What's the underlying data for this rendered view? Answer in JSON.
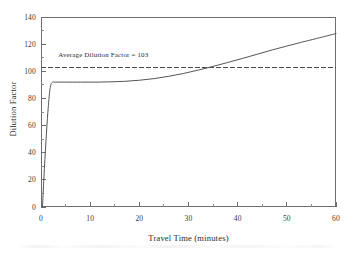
{
  "chart_data": {
    "type": "line",
    "title": "",
    "xlabel": "Travel Time (minutes)",
    "ylabel": "Dilution Factor",
    "xlim": [
      0,
      60
    ],
    "ylim": [
      0,
      140
    ],
    "grid": false,
    "legend": "none",
    "xticks": [
      0,
      10,
      20,
      30,
      40,
      50,
      60
    ],
    "xtick_labels": [
      "0",
      "10",
      "20",
      "30",
      "40",
      "50",
      "60"
    ],
    "x_minor_tick_interval": 5,
    "yticks": [
      0,
      20,
      40,
      60,
      80,
      100,
      120,
      140
    ],
    "ytick_labels": [
      "0",
      "20",
      "40",
      "60",
      "80",
      "100",
      "120",
      "140"
    ],
    "y_minor_tick_interval": 10,
    "series": [
      {
        "name": "Dilution Factor",
        "style": "solid",
        "color": "#555555",
        "x": [
          0.3,
          0.6,
          1.0,
          1.4,
          1.8,
          2.2,
          3.0,
          5.0,
          8.0,
          11.0,
          14.0,
          17.0,
          20.0,
          23.0,
          26.0,
          29.0,
          32.0,
          35.0,
          38.0,
          41.0,
          44.0,
          47.0,
          50.0,
          53.0,
          56.0,
          60.0
        ],
        "y": [
          0,
          22,
          48,
          70,
          86,
          91.5,
          92,
          92,
          92,
          92,
          92.2,
          92.6,
          93.4,
          94.6,
          96.3,
          98.4,
          100.9,
          103.6,
          106.5,
          109.5,
          112.6,
          115.7,
          118.6,
          121.4,
          124.1,
          127.8
        ]
      }
    ],
    "annotations": [
      {
        "name": "average-dilution-factor",
        "text": "Average Dilution Factor = 103",
        "type": "hline-with-label",
        "value": 103,
        "style": "dashed",
        "color": "#4a4a4a",
        "label_x": 3.5,
        "label_y": 111
      }
    ]
  }
}
